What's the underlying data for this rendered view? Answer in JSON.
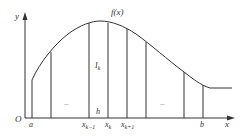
{
  "diagram": {
    "type": "riemann-partition",
    "curve_label": "f(x)",
    "axis": {
      "x_label": "x",
      "y_label": "y",
      "origin_label": "O"
    },
    "area_label": {
      "main": "I",
      "sub": "k"
    },
    "step_label": "h",
    "ellipsis": [
      "···",
      "···"
    ],
    "ticks": [
      {
        "main": "a",
        "sub": ""
      },
      {
        "main": "x",
        "sub": "k−1"
      },
      {
        "main": "x",
        "sub": "k"
      },
      {
        "main": "x",
        "sub": "k+1"
      },
      {
        "main": "b",
        "sub": ""
      }
    ],
    "colors": {
      "line": "#333333",
      "curve": "#333333",
      "background": "#ffffff"
    }
  }
}
